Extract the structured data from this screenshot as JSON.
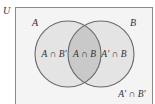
{
  "diagram": {
    "type": "venn",
    "universe_label": "U",
    "sets": [
      {
        "name": "A",
        "label": "A"
      },
      {
        "name": "B",
        "label": "B"
      }
    ],
    "regions": {
      "a_only": "A ∩ B′",
      "intersection": "A ∩ B",
      "b_only": "A′ ∩ B",
      "outside": "A′ ∩ B′"
    },
    "colors": {
      "circle_fill": "#e4e4e4",
      "intersection_fill": "#c9c9c9",
      "circle_stroke": "#6a6a6a",
      "universe_border": "#8a8a8a",
      "universe_fill": "#f4f4f4",
      "text": "#333333"
    }
  }
}
